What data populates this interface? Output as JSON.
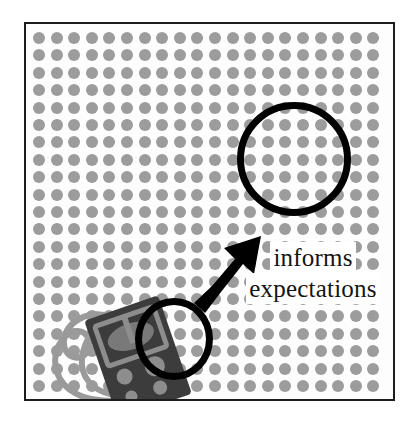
{
  "figure": {
    "type": "diagram",
    "title": "",
    "frame": {
      "border_color": "#1d1d1d",
      "background_color": "#fdfdfd"
    },
    "background_pattern": {
      "name": "dot-grid",
      "dot_color": "#9c9c9c",
      "dot_diameter_px": 12,
      "spacing_x_px": 17.6,
      "spacing_y_px": 17.4,
      "columns": 20,
      "rows": 21
    },
    "annotations": {
      "caption_lines": [
        "informs",
        "expectations"
      ],
      "caption_full_text": "informs expectations",
      "caption_color": "#141414"
    },
    "shapes": [
      {
        "name": "sample-region-circle",
        "role": "small magnifier circle over sampled area",
        "stroke_color": "#000000",
        "stroke_width_px": 7
      },
      {
        "name": "inference-region-circle",
        "role": "large magnifier circle over inferred area",
        "stroke_color": "#000000",
        "stroke_width_px": 7
      },
      {
        "name": "inference-arrow",
        "role": "arrow from sampled region to inferred region",
        "fill_color": "#000000",
        "direction": "up-right"
      }
    ],
    "objects": [
      {
        "name": "handheld-device",
        "description": "dark handheld counting device with lanyard cord",
        "body_color": "#3a3a3a",
        "detail_color": "#8a8a8a",
        "cord_color": "#9a9a9a"
      }
    ]
  }
}
